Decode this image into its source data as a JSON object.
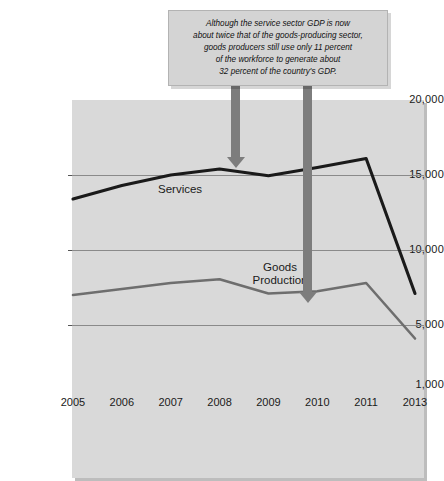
{
  "chart_data": {
    "type": "line",
    "title": "",
    "xlabel": "",
    "ylabel": "Billions",
    "x": [
      "2005",
      "2006",
      "2007",
      "2008",
      "2009",
      "2010",
      "2011",
      "2013"
    ],
    "ylim": [
      1000,
      20000
    ],
    "yticks": [
      "20,000",
      "15,000",
      "10,000",
      "5,000",
      "1,000"
    ],
    "ytick_values": [
      20000,
      15000,
      10000,
      5000,
      1000
    ],
    "grid": true,
    "legend_position": "inline-labels",
    "series": [
      {
        "name": "Services",
        "values": [
          13400,
          14300,
          15000,
          15400,
          14950,
          15500,
          16100,
          7100
        ],
        "color": "#1a1a1a"
      },
      {
        "name": "Goods Production",
        "values": [
          7000,
          7400,
          7800,
          8050,
          7100,
          7250,
          7800,
          4100
        ],
        "color": "#6e6e6e"
      }
    ],
    "annotations": [
      {
        "name": "callout",
        "lines": [
          "Although the service sector GDP is now",
          "about twice that of the goods-producing sector,",
          "goods producers still use only 11 percent",
          "of the workforce to generate about",
          "32 percent of the country's GDP."
        ],
        "arrows": [
          {
            "name": "arrow-to-services",
            "target_series": "Services",
            "target_x": "2008"
          },
          {
            "name": "arrow-to-goods",
            "target_series": "Goods Production",
            "target_x": "2009"
          }
        ]
      }
    ],
    "series_label_text": {
      "services": "Services",
      "goods_line1": "Goods",
      "goods_line2": "Production"
    },
    "colors": {
      "plot_background": "#d9d9d9",
      "gridline": "#8a8a8a",
      "services_line": "#1a1a1a",
      "goods_line": "#6e6e6e",
      "arrow": "#7d7d7d",
      "callout_background": "#d4d4d4"
    }
  }
}
